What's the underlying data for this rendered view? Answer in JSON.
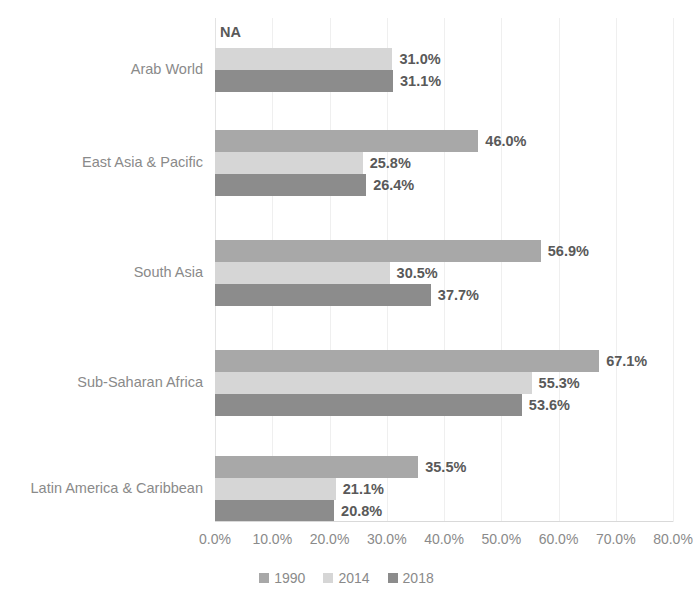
{
  "chart_data": {
    "type": "bar",
    "orientation": "horizontal",
    "title": "",
    "xlabel": "",
    "ylabel": "",
    "xlim": [
      0,
      80
    ],
    "xtick_labels": [
      "0.0%",
      "10.0%",
      "20.0%",
      "30.0%",
      "40.0%",
      "50.0%",
      "60.0%",
      "70.0%",
      "80.0%"
    ],
    "xtick_values": [
      0,
      10,
      20,
      30,
      40,
      50,
      60,
      70,
      80
    ],
    "grid": true,
    "legend_position": "bottom",
    "categories": [
      "Arab World",
      "East Asia & Pacific",
      "South Asia",
      "Sub-Saharan Africa",
      "Latin America & Caribbean"
    ],
    "series": [
      {
        "name": "1990",
        "color": "#a8a8a8",
        "values": [
          null,
          46.0,
          56.9,
          67.1,
          35.5
        ],
        "labels": [
          "NA",
          "46.0%",
          "56.9%",
          "67.1%",
          "35.5%"
        ]
      },
      {
        "name": "2014",
        "color": "#d6d6d6",
        "values": [
          31.0,
          25.8,
          30.5,
          55.3,
          21.1
        ],
        "labels": [
          "31.0%",
          "25.8%",
          "30.5%",
          "55.3%",
          "21.1%"
        ]
      },
      {
        "name": "2018",
        "color": "#8c8c8c",
        "values": [
          31.1,
          26.4,
          37.7,
          53.6,
          20.8
        ],
        "labels": [
          "31.1%",
          "26.4%",
          "37.7%",
          "53.6%",
          "20.8%"
        ]
      }
    ],
    "annotations": [
      {
        "text": "NA",
        "category": "Arab World",
        "series": "1990",
        "note": "value not available"
      }
    ]
  },
  "legend": {
    "items": [
      {
        "label": "1990",
        "color": "#a8a8a8"
      },
      {
        "label": "2014",
        "color": "#d6d6d6"
      },
      {
        "label": "2018",
        "color": "#8c8c8c"
      }
    ]
  }
}
